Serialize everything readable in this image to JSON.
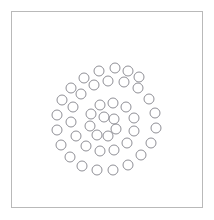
{
  "figure": {
    "title": "",
    "background_color": "#ffffff",
    "border_color": "#b9b9b9",
    "border_width_px": 1,
    "frame": {
      "x": 11,
      "y": 11,
      "width": 192,
      "height": 197
    }
  },
  "chart_data": {
    "type": "scatter",
    "title": "",
    "subtitle": "",
    "xlabel": "",
    "ylabel": "",
    "xlim": [
      11,
      203
    ],
    "ylim": [
      11,
      208
    ],
    "grid": false,
    "legend": null,
    "annotations": [],
    "marker": {
      "shape": "circle-open",
      "radius_px": 5,
      "edge_color": "#8f8f96",
      "fill_color": "none",
      "edge_width_px": 1
    },
    "center": {
      "x": 108,
      "y": 122
    },
    "point_count": 44,
    "series": [
      {
        "name": "spiral",
        "points": [
          {
            "x": 104,
            "y": 117
          },
          {
            "x": 114,
            "y": 119
          },
          {
            "x": 116,
            "y": 129
          },
          {
            "x": 108,
            "y": 136
          },
          {
            "x": 97,
            "y": 135
          },
          {
            "x": 90,
            "y": 126
          },
          {
            "x": 91,
            "y": 114
          },
          {
            "x": 100,
            "y": 105
          },
          {
            "x": 113,
            "y": 103
          },
          {
            "x": 126,
            "y": 107
          },
          {
            "x": 134,
            "y": 118
          },
          {
            "x": 134,
            "y": 131
          },
          {
            "x": 127,
            "y": 143
          },
          {
            "x": 114,
            "y": 150
          },
          {
            "x": 100,
            "y": 151
          },
          {
            "x": 86,
            "y": 146
          },
          {
            "x": 76,
            "y": 136
          },
          {
            "x": 71,
            "y": 122
          },
          {
            "x": 73,
            "y": 107
          },
          {
            "x": 81,
            "y": 94
          },
          {
            "x": 94,
            "y": 85
          },
          {
            "x": 108,
            "y": 81
          },
          {
            "x": 124,
            "y": 82
          },
          {
            "x": 138,
            "y": 88
          },
          {
            "x": 149,
            "y": 99
          },
          {
            "x": 155,
            "y": 113
          },
          {
            "x": 156,
            "y": 128
          },
          {
            "x": 151,
            "y": 143
          },
          {
            "x": 141,
            "y": 155
          },
          {
            "x": 128,
            "y": 165
          },
          {
            "x": 113,
            "y": 170
          },
          {
            "x": 97,
            "y": 170
          },
          {
            "x": 82,
            "y": 166
          },
          {
            "x": 70,
            "y": 157
          },
          {
            "x": 61,
            "y": 145
          },
          {
            "x": 57,
            "y": 130
          },
          {
            "x": 57,
            "y": 115
          },
          {
            "x": 62,
            "y": 100
          },
          {
            "x": 71,
            "y": 88
          },
          {
            "x": 84,
            "y": 78
          },
          {
            "x": 99,
            "y": 71
          },
          {
            "x": 115,
            "y": 68
          },
          {
            "x": 128,
            "y": 71
          },
          {
            "x": 139,
            "y": 77
          }
        ]
      }
    ]
  }
}
